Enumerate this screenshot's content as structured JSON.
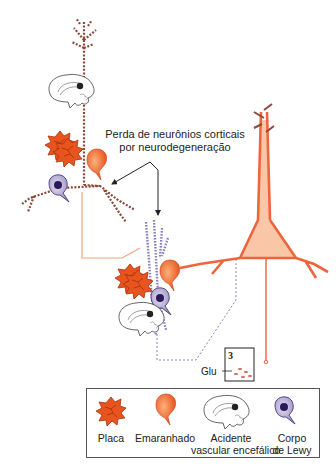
{
  "diagram": {
    "callout": {
      "line1": "Perda de neurônios corticais",
      "line2": "por neurodegeneração"
    },
    "synapse_box": {
      "number": "3",
      "neurotransmitter_label": "Glu"
    },
    "legend": {
      "items": [
        {
          "icon": "plaque-icon",
          "label_line1": "Placa",
          "label_line2": ""
        },
        {
          "icon": "tangle-icon",
          "label_line1": "Emaranhado",
          "label_line2": ""
        },
        {
          "icon": "brain-stroke-icon",
          "label_line1": "Acidente",
          "label_line2": "vascular encefálico"
        },
        {
          "icon": "lewy-body-icon",
          "label_line1": "Corpo",
          "label_line2": "de Lewy"
        }
      ]
    },
    "colors": {
      "neuron_orange": "#f0643c",
      "neuron_fill": "#f9c6a8",
      "degenerated_brown": "#8b4a3a",
      "degenerated_purple": "#8a7fc4",
      "plaque_orange": "#e8541e",
      "lewy_purple": "#3a2a6a",
      "arrow": "#222222"
    }
  }
}
